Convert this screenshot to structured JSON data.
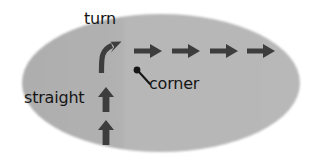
{
  "figure": {
    "type": "motion-field-diagram",
    "background_color": "#ffffff",
    "region": {
      "name": "road-patch-ellipse",
      "fill_color": "#b0b0b0",
      "fill_color_right": "#b6b6b6",
      "center_x": 161,
      "center_y": 83,
      "radius_x": 140,
      "radius_y": 70
    },
    "arrow_color": "#3d3d3d",
    "labels": {
      "turn": "turn",
      "straight": "straight",
      "corner": "corner"
    },
    "annotations": {
      "corner_dot": {
        "x": 137,
        "y": 70,
        "radius": 3.2
      },
      "corner_leader_line": {
        "x1": 139,
        "y1": 72,
        "x2": 150,
        "y2": 84
      }
    },
    "arrows": {
      "straight_vertical": [
        {
          "x": 106,
          "y_tail": 112,
          "y_head": 88,
          "direction": "up"
        },
        {
          "x": 106,
          "y_tail": 145,
          "y_head": 121,
          "direction": "up"
        }
      ],
      "turn_curved": {
        "start_x": 101,
        "start_y": 72,
        "end_x": 120,
        "end_y": 42,
        "direction": "up-right-curve"
      },
      "straight_horizontal": [
        {
          "x_tail": 134,
          "x_head": 162,
          "y": 51,
          "direction": "right"
        },
        {
          "x_tail": 172,
          "x_head": 200,
          "y": 51,
          "direction": "right"
        },
        {
          "x_tail": 210,
          "x_head": 238,
          "y": 51,
          "direction": "right"
        },
        {
          "x_tail": 247,
          "x_head": 275,
          "y": 51,
          "direction": "right"
        }
      ]
    }
  }
}
